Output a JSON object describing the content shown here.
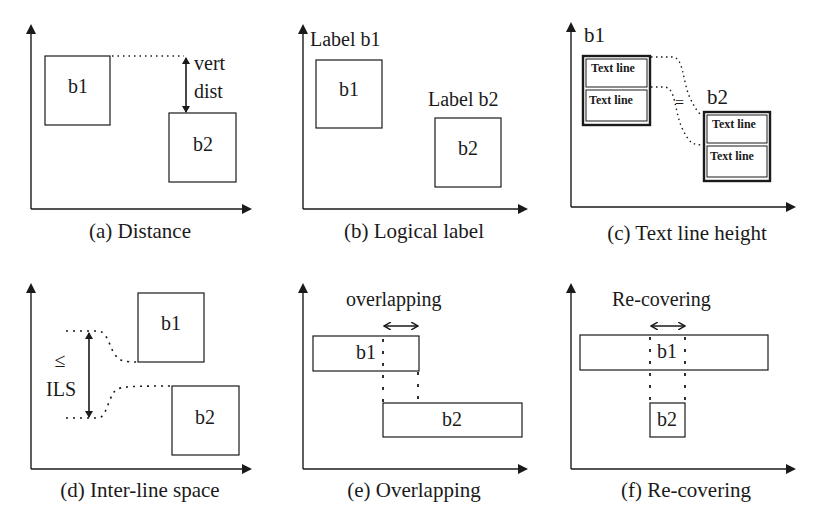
{
  "panels": {
    "a": {
      "caption": "(a) Distance",
      "box1": "b1",
      "box2": "b2",
      "annotation_line1": "vert",
      "annotation_line2": "dist"
    },
    "b": {
      "caption": "(b) Logical label",
      "box1": "b1",
      "box2": "b2",
      "label1": "Label b1",
      "label2": "Label b2"
    },
    "c": {
      "caption": "(c) Text line height",
      "box1": "b1",
      "box2": "b2",
      "text_line": "Text line",
      "equals": "="
    },
    "d": {
      "caption": "(d) Inter-line space",
      "box1": "b1",
      "box2": "b2",
      "leq": "≤",
      "ils": "ILS"
    },
    "e": {
      "caption": "(e) Overlapping",
      "box1": "b1",
      "box2": "b2",
      "annotation": "overlapping"
    },
    "f": {
      "caption": "(f) Re-covering",
      "box1": "b1",
      "box2": "b2",
      "annotation": "Re-covering"
    }
  },
  "colors": {
    "ink": "#1a1a1a",
    "background": "#ffffff"
  }
}
